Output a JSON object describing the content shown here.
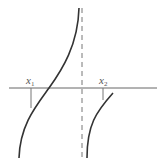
{
  "diagram": {
    "type": "function-graph-with-vertical-asymptote",
    "colors": {
      "curve": "#333333",
      "axis": "#666666",
      "asymptote": "#777777",
      "label": "#555555"
    },
    "axis": {
      "x1": 9,
      "x2": 157,
      "y": 88
    },
    "asymptote": {
      "x": 82,
      "y1": 8,
      "y2": 160,
      "style": "dashed"
    },
    "labels": [
      {
        "id": "x1",
        "base": "x",
        "sub": "1",
        "x": 26,
        "y": 84
      },
      {
        "id": "x2",
        "base": "x",
        "sub": "2",
        "x": 99,
        "y": 84
      }
    ],
    "ticks": [
      {
        "id": "x1",
        "x": 31,
        "y1": 88,
        "y2": 108
      },
      {
        "id": "x2",
        "x": 103,
        "y1": 88,
        "y2": 100
      }
    ],
    "branches": [
      {
        "id": "left",
        "path": "M79,8 C78,45 62,70 49,88 C36,106 20,125 19,158"
      },
      {
        "id": "right",
        "path": "M87,158 C87,125 96,112 113,93"
      }
    ]
  }
}
